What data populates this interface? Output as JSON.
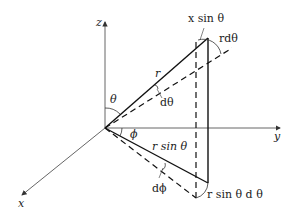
{
  "diagram": {
    "type": "spherical-coordinates-differential-area",
    "axes": {
      "z_label": "z",
      "y_label": "y",
      "x_label": "x"
    },
    "labels": {
      "theta": "θ",
      "phi": "ϕ",
      "r": "r",
      "d_theta": "dθ",
      "d_phi": "dϕ",
      "r_sin_theta": "r sin θ",
      "x_sin_theta": "x sin θ",
      "r_d_theta": "rdθ",
      "r_sin_theta_d_theta": "r sin θ d θ"
    },
    "colors": {
      "line": "#111111",
      "axis": "#555555",
      "background": "#ffffff"
    }
  }
}
